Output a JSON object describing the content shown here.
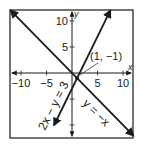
{
  "chart_data": {
    "type": "line",
    "title": "",
    "xlabel": "x",
    "ylabel": "y",
    "xlim": [
      -12,
      12
    ],
    "ylim": [
      -12,
      12.5
    ],
    "grid": false,
    "x_ticks": [
      -10,
      -5,
      5,
      10
    ],
    "y_ticks": [
      5,
      10
    ],
    "x_tick_labels": [
      "−10",
      "−5",
      "5",
      "10"
    ],
    "y_tick_labels": [
      "5",
      "10"
    ],
    "hidden_ticks": {
      "x": [],
      "y": [
        -5,
        -10
      ]
    },
    "series": [
      {
        "name": "2x − y = 3",
        "equation": "y = 2x - 3",
        "slope": 2,
        "intercept": -3,
        "x_range": [
          -3.5,
          7.5
        ]
      },
      {
        "name": "y = −x",
        "equation": "y = -x",
        "slope": -1,
        "intercept": 0,
        "x_range": [
          -12,
          12
        ]
      }
    ],
    "annotations": [
      {
        "text": "(1, −1)",
        "point": [
          1,
          -1
        ]
      }
    ],
    "colors": {
      "line": "#1a1a1a",
      "frame": "#1a1a1a",
      "background": "#ffffff"
    }
  }
}
